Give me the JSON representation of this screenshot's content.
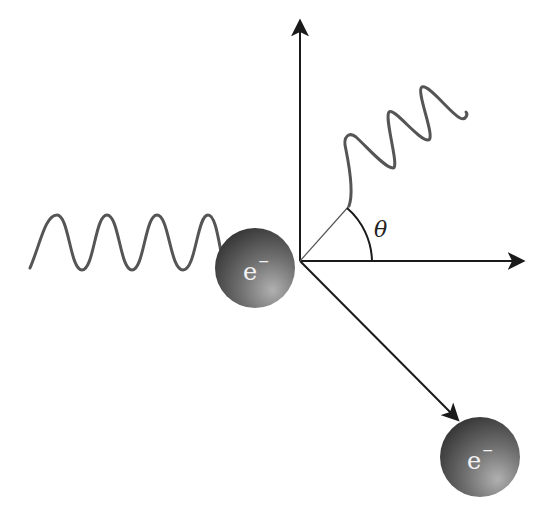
{
  "diagram": {
    "type": "compton-scattering",
    "labels": {
      "electron_initial": "e",
      "electron_initial_sup": "−",
      "electron_scattered": "e",
      "electron_scattered_sup": "−",
      "angle": "θ"
    },
    "colors": {
      "axis": "#1a1a1a",
      "wave": "#555555",
      "electron_dark": "#3a3a3a",
      "electron_light": "#9a9a9a",
      "label": "#f2f2f2"
    },
    "elements": [
      {
        "name": "incident-photon-wave",
        "description": "Incoming sinusoidal photon, 4 crests, left of electron"
      },
      {
        "name": "electron-initial",
        "description": "Shaded sphere labeled e− at collision point"
      },
      {
        "name": "vertical-axis",
        "description": "Upward arrow from origin"
      },
      {
        "name": "horizontal-axis",
        "description": "Rightward arrow from origin"
      },
      {
        "name": "scattered-photon-wave",
        "description": "Outgoing photon wave at angle θ above horizontal"
      },
      {
        "name": "angle-arc",
        "description": "Arc marking scattering angle θ"
      },
      {
        "name": "recoil-electron-arrow",
        "description": "Diagonal arrow down-right to scattered electron"
      },
      {
        "name": "electron-scattered",
        "description": "Shaded sphere labeled e− after recoil"
      }
    ]
  }
}
